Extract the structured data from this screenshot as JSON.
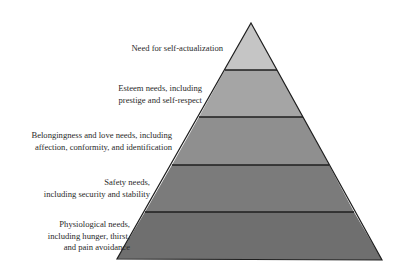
{
  "diagram": {
    "type": "pyramid",
    "levels": [
      {
        "rank": 5,
        "lines": [
          "Need for self-actualization"
        ],
        "fill": "#c5c5c5"
      },
      {
        "rank": 4,
        "lines": [
          "Esteem needs, including",
          "prestige and self-respect"
        ],
        "fill": "#a5a5a5"
      },
      {
        "rank": 3,
        "lines": [
          "Belongingness and love needs, including",
          "affection, conformity, and identification"
        ],
        "fill": "#8f8f8f"
      },
      {
        "rank": 2,
        "lines": [
          "Safety needs,",
          "including security and stability"
        ],
        "fill": "#7b7b7b"
      },
      {
        "rank": 1,
        "lines": [
          "Physiological needs,",
          "including hunger, thirst,",
          "and pain avoidance"
        ],
        "fill": "#6f6f6f"
      }
    ],
    "outline_color": "#1e1e1e"
  }
}
